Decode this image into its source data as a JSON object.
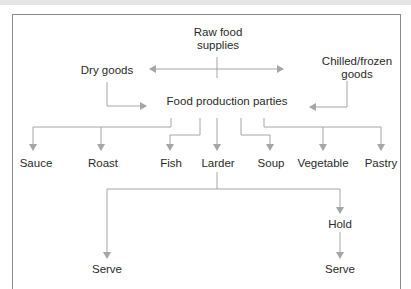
{
  "diagram": {
    "nodes": {
      "raw_food": "Raw food\nsupplies",
      "raw_food_line1": "Raw food",
      "raw_food_line2": "supplies",
      "dry_goods": "Dry goods",
      "chilled_line1": "Chilled/frozen",
      "chilled_line2": "goods",
      "production": "Food production parties",
      "sauce": "Sauce",
      "roast": "Roast",
      "fish": "Fish",
      "larder": "Larder",
      "soup": "Soup",
      "vegetable": "Vegetable",
      "pastry": "Pastry",
      "hold": "Hold",
      "serve_left": "Serve",
      "serve_right": "Serve"
    },
    "edges": [
      {
        "from": "Raw food supplies",
        "to": "Dry goods"
      },
      {
        "from": "Raw food supplies",
        "to": "Chilled/frozen goods"
      },
      {
        "from": "Dry goods",
        "to": "Food production parties"
      },
      {
        "from": "Chilled/frozen goods",
        "to": "Food production parties"
      },
      {
        "from": "Food production parties",
        "to": "Sauce"
      },
      {
        "from": "Food production parties",
        "to": "Roast"
      },
      {
        "from": "Food production parties",
        "to": "Fish"
      },
      {
        "from": "Food production parties",
        "to": "Larder"
      },
      {
        "from": "Food production parties",
        "to": "Soup"
      },
      {
        "from": "Food production parties",
        "to": "Vegetable"
      },
      {
        "from": "Food production parties",
        "to": "Pastry"
      },
      {
        "from": "Larder",
        "to": "Serve"
      },
      {
        "from": "Larder",
        "to": "Hold"
      },
      {
        "from": "Hold",
        "to": "Serve"
      }
    ],
    "colors": {
      "line": "#a6a6a6",
      "text": "#2a2a2a",
      "frame": "#8a8a8a"
    }
  }
}
